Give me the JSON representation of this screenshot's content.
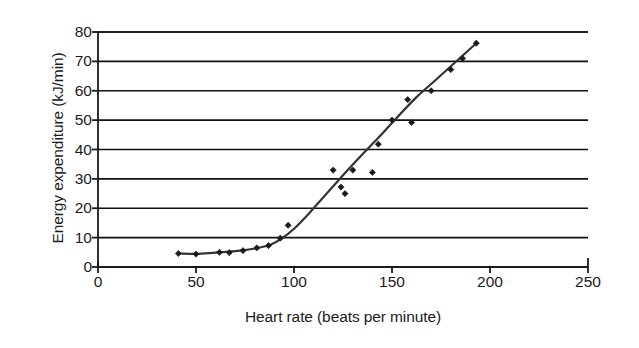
{
  "chart_data": {
    "type": "scatter",
    "title": "",
    "xlabel": "Heart rate (beats per minute)",
    "ylabel": "Energy expenditure (kJ/min)",
    "xlim": [
      0,
      250
    ],
    "ylim": [
      0,
      80
    ],
    "xticks": [
      0,
      50,
      100,
      150,
      200,
      250
    ],
    "yticks": [
      0,
      10,
      20,
      30,
      40,
      50,
      60,
      70,
      80
    ],
    "grid": "horizontal",
    "legend": "none",
    "series": [
      {
        "name": "Observations",
        "marker": "diamond",
        "color": "#1a1a1a",
        "points": [
          [
            41,
            4.6
          ],
          [
            50,
            4.4
          ],
          [
            62,
            5.0
          ],
          [
            67,
            4.9
          ],
          [
            74,
            5.6
          ],
          [
            81,
            6.5
          ],
          [
            87,
            7.3
          ],
          [
            93,
            9.8
          ],
          [
            97,
            14.2
          ],
          [
            120,
            33.0
          ],
          [
            124,
            27.2
          ],
          [
            126,
            25.0
          ],
          [
            130,
            33.0
          ],
          [
            140,
            32.2
          ],
          [
            143,
            41.8
          ],
          [
            150,
            50.0
          ],
          [
            158,
            57.0
          ],
          [
            160,
            49.2
          ],
          [
            170,
            60.0
          ],
          [
            180,
            67.2
          ],
          [
            186,
            71.0
          ],
          [
            193,
            76.2
          ]
        ]
      }
    ],
    "fitted_curve": {
      "name": "Fitted trend line",
      "color": "#333333",
      "points": [
        [
          41,
          4.6
        ],
        [
          50,
          4.5
        ],
        [
          60,
          4.9
        ],
        [
          70,
          5.4
        ],
        [
          80,
          6.3
        ],
        [
          88,
          7.6
        ],
        [
          94,
          9.8
        ],
        [
          100,
          13.0
        ],
        [
          108,
          18.5
        ],
        [
          116,
          24.5
        ],
        [
          124,
          30.5
        ],
        [
          133,
          37.0
        ],
        [
          143,
          44.0
        ],
        [
          152,
          50.5
        ],
        [
          162,
          57.5
        ],
        [
          172,
          63.5
        ],
        [
          182,
          69.5
        ],
        [
          193,
          76.2
        ]
      ]
    }
  },
  "axis": {
    "x_tick_labels": [
      "0",
      "50",
      "100",
      "150",
      "200",
      "250"
    ],
    "y_tick_labels": [
      "0",
      "10",
      "20",
      "30",
      "40",
      "50",
      "60",
      "70",
      "80"
    ],
    "x_title": "Heart rate (beats per minute)",
    "y_title": "Energy expenditure (kJ/min)"
  },
  "colors": {
    "axis": "#1a1a1a",
    "gridline": "#111111",
    "marker": "#1a1a1a",
    "curve": "#333333",
    "background": "#ffffff"
  }
}
